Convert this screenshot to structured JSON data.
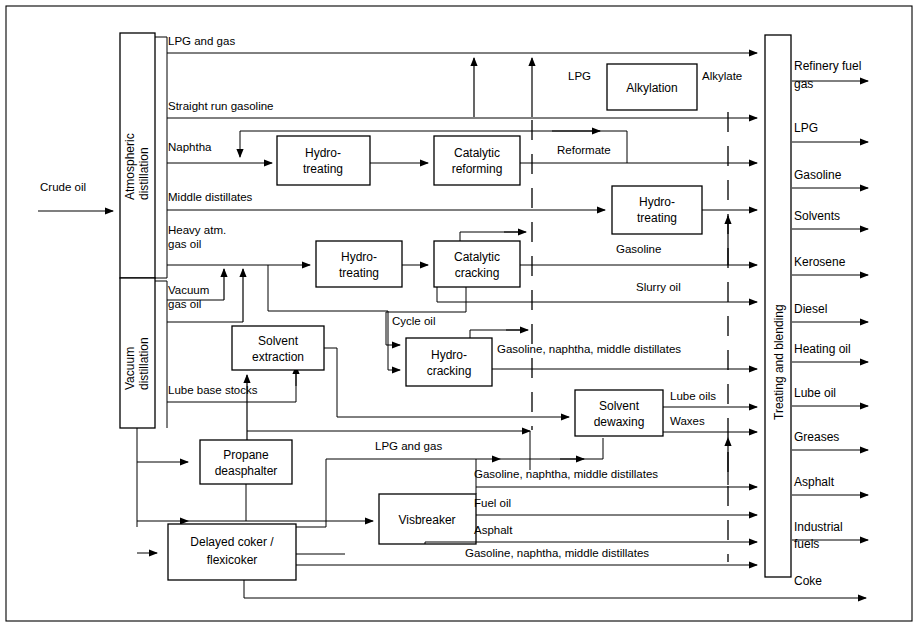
{
  "diagram": {
    "feed": {
      "label": "Crude oil"
    },
    "units": {
      "atmospheric_distillation": "Atmospheric\ndistillation",
      "atmospheric_distillation_line1": "Atmospheric",
      "atmospheric_distillation_line2": "distillation",
      "vacuum_distillation_line1": "Vacuum",
      "vacuum_distillation_line2": "distillation",
      "hydrotreating_naphtha_line1": "Hydro-",
      "hydrotreating_naphtha_line2": "treating",
      "catalytic_reforming_line1": "Catalytic",
      "catalytic_reforming_line2": "reforming",
      "alkylation": "Alkylation",
      "hydrotreating_middle_line1": "Hydro-",
      "hydrotreating_middle_line2": "treating",
      "hydrotreating_gasoil_line1": "Hydro-",
      "hydrotreating_gasoil_line2": "treating",
      "catalytic_cracking_line1": "Catalytic",
      "catalytic_cracking_line2": "cracking",
      "hydrocracking_line1": "Hydro-",
      "hydrocracking_line2": "cracking",
      "solvent_extraction_line1": "Solvent",
      "solvent_extraction_line2": "extraction",
      "solvent_dewaxing_line1": "Solvent",
      "solvent_dewaxing_line2": "dewaxing",
      "propane_deasphalter_line1": "Propane",
      "propane_deasphalter_line2": "deasphalter",
      "delayed_coker_line1": "Delayed coker /",
      "delayed_coker_line2": "flexicoker",
      "visbreaker": "Visbreaker",
      "treating_and_blending": "Treating and blending"
    },
    "stream_labels": {
      "lpg_and_gas_top": "LPG and  gas",
      "straight_run_gasoline": "Straight run gasoline",
      "naphtha": "Naphtha",
      "middle_distillates": "Middle distillates",
      "heavy_atm_gas_oil_line1": "Heavy atm.",
      "heavy_atm_gas_oil_line2": "gas oil",
      "vacuum_gas_oil_line1": "Vacuum",
      "vacuum_gas_oil_line2": "gas oil",
      "lube_base_stocks": "Lube base stocks",
      "lpg_alkylation_in": "LPG",
      "alkylate": "Alkylate",
      "reformate": "Reformate",
      "gasoline_from_fcc": "Gasoline",
      "slurry_oil": "Slurry oil",
      "cycle_oil": "Cycle oil",
      "gnm_hydrocracking": "Gasoline, naphtha, middle distillates",
      "lube_oils": "Lube oils",
      "waxes": "Waxes",
      "lpg_and_gas_lower": "LPG and  gas",
      "gnm_visbreaker": "Gasoline, naphtha, middle distillates",
      "fuel_oil": "Fuel oil",
      "asphalt_visbreaker": "Asphalt",
      "gnm_coker": "Gasoline, naphtha, middle distillates"
    },
    "products": [
      {
        "name": "refinery-fuel-gas",
        "line1": "Refinery fuel",
        "line2": "gas"
      },
      {
        "name": "lpg",
        "line1": "LPG",
        "line2": ""
      },
      {
        "name": "gasoline",
        "line1": "Gasoline",
        "line2": ""
      },
      {
        "name": "solvents",
        "line1": "Solvents",
        "line2": ""
      },
      {
        "name": "kerosene",
        "line1": "Kerosene",
        "line2": ""
      },
      {
        "name": "diesel",
        "line1": "Diesel",
        "line2": ""
      },
      {
        "name": "heating-oil",
        "line1": "Heating oil",
        "line2": ""
      },
      {
        "name": "lube-oil",
        "line1": "Lube oil",
        "line2": ""
      },
      {
        "name": "greases",
        "line1": "Greases",
        "line2": ""
      },
      {
        "name": "asphalt",
        "line1": "Asphalt",
        "line2": ""
      },
      {
        "name": "industrial-fuels",
        "line1": "Industrial",
        "line2": "fuels"
      },
      {
        "name": "coke",
        "line1": "Coke",
        "line2": ""
      }
    ],
    "colors": {
      "line": "#000000",
      "background": "#ffffff",
      "box_fill": "#ffffff"
    }
  }
}
